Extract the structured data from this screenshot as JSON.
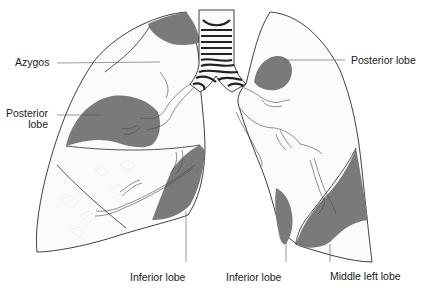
{
  "diagram": {
    "colors": {
      "shaded_region": "#7a7a7a",
      "outline": "#2a2a2a",
      "background": "#ffffff"
    },
    "labels": {
      "azygos": "Azygos",
      "posterior_lobe_left_line1": "Posterior",
      "posterior_lobe_left_line2": "lobe",
      "posterior_lobe_right": "Posterior lobe",
      "inferior_lobe_right_lung": "Inferior lobe",
      "inferior_lobe_left_lung": "Inferior lobe",
      "middle_left_lobe": "Middle left lobe"
    },
    "structures": [
      "trachea",
      "right-lung",
      "left-lung",
      "bronchi"
    ]
  }
}
